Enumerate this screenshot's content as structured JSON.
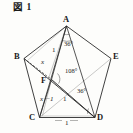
{
  "figure": {
    "caption": "図 1",
    "shape_name": "regular-pentagon",
    "vertices": [
      {
        "id": "A",
        "label": "A",
        "x": 66.5,
        "y": 26.0,
        "label_x": 63.0,
        "label_y": 17.0
      },
      {
        "id": "B",
        "label": "B",
        "x": 24.0,
        "y": 58.5,
        "label_x": 15.0,
        "label_y": 54.0
      },
      {
        "id": "C",
        "label": "C",
        "x": 39.5,
        "y": 117.5,
        "label_x": 30.5,
        "label_y": 114.5
      },
      {
        "id": "D",
        "label": "D",
        "x": 95.0,
        "y": 117.5,
        "label_x": 96.5,
        "label_y": 114.5
      },
      {
        "id": "E",
        "label": "E",
        "x": 111.0,
        "y": 58.5,
        "label_x": 113.0,
        "label_y": 54.0
      },
      {
        "id": "F",
        "label": "F",
        "x": 51.5,
        "y": 79.5,
        "label_x": 41.5,
        "label_y": 78.0
      }
    ],
    "angles": [
      {
        "id": "angle-a",
        "value": "36°",
        "label_x": 66.0,
        "label_y": 44.5
      },
      {
        "id": "angle-f",
        "value": "108°",
        "label_x": 67.5,
        "label_y": 71.5
      },
      {
        "id": "angle-d",
        "value": "36°",
        "label_x": 79.0,
        "label_y": 91.0
      }
    ],
    "segments": [
      {
        "id": "seg-af",
        "value": "1",
        "label_x": 53.5,
        "label_y": 51.0,
        "kind": "num"
      },
      {
        "id": "seg-bf",
        "value": "x",
        "label_x": 42.5,
        "label_y": 62.5,
        "kind": "var"
      },
      {
        "id": "seg-cf",
        "value": "x－1",
        "label_x": 41.5,
        "label_y": 99.0,
        "kind": "var"
      },
      {
        "id": "seg-fd",
        "value": "1",
        "label_x": 63.5,
        "label_y": 99.5,
        "kind": "num"
      },
      {
        "id": "seg-cd",
        "value": "1",
        "label_x": 65.5,
        "label_y": 122.5,
        "kind": "num"
      }
    ],
    "colors": {
      "stroke": "#2b2b2b",
      "background": "#fdfdfb",
      "text": "#1a1a1a"
    }
  }
}
